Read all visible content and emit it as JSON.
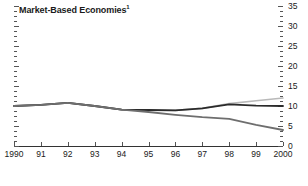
{
  "chart_data": {
    "type": "line",
    "title": "Market-Based Economies",
    "title_footnote_marker": "1",
    "xlabel": "",
    "ylabel": "",
    "x": [
      1990,
      1991,
      1992,
      1993,
      1994,
      1995,
      1996,
      1997,
      1998,
      1999,
      2000
    ],
    "xtick_labels": [
      "1990",
      "91",
      "92",
      "93",
      "94",
      "95",
      "96",
      "97",
      "98",
      "99",
      "2000"
    ],
    "ytick_labels": [
      "0",
      "5",
      "10",
      "15",
      "20",
      "25",
      "30",
      "35"
    ],
    "ytick_values": [
      0,
      5,
      10,
      15,
      20,
      25,
      30,
      35
    ],
    "ylim": [
      0,
      35
    ],
    "xlim": [
      1990,
      2000
    ],
    "minor_ticks": true,
    "minor_tick_step": 1.25,
    "grid": false,
    "y_axis_position": "right",
    "legend": "none",
    "series": [
      {
        "name": "series-light-gray",
        "color": "#b9b9b9",
        "width": 1.6,
        "values": [
          10.0,
          10.3,
          10.8,
          10.0,
          9.1,
          9.0,
          8.9,
          9.4,
          10.6,
          11.3,
          12.0
        ]
      },
      {
        "name": "series-dark-upper",
        "color": "#2b2b2b",
        "width": 1.8,
        "values": [
          10.0,
          10.3,
          10.8,
          10.0,
          9.1,
          9.0,
          8.9,
          9.4,
          10.4,
          10.1,
          10.0
        ]
      },
      {
        "name": "series-dark-declining",
        "color": "#6e6e6e",
        "width": 1.8,
        "values": [
          10.0,
          10.3,
          10.8,
          10.0,
          9.1,
          8.5,
          7.8,
          7.2,
          6.8,
          5.3,
          4.0
        ]
      }
    ],
    "axis_color": "#333333",
    "tick_color": "#555555",
    "text_color": "#1a1a1a"
  }
}
